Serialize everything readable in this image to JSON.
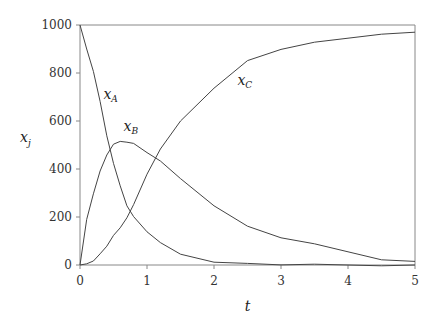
{
  "chart_data": {
    "type": "line",
    "title": "",
    "xlabel": "t",
    "ylabel": "x_j",
    "xlim": [
      0,
      5
    ],
    "ylim": [
      0,
      1000
    ],
    "xticks": [
      "0",
      "1",
      "2",
      "3",
      "4",
      "5"
    ],
    "yticks": [
      "0",
      "200",
      "400",
      "600",
      "800",
      "1000"
    ],
    "grid": false,
    "legend": "inline labels",
    "x": [
      0,
      0.1,
      0.2,
      0.3,
      0.4,
      0.5,
      0.6,
      0.7,
      0.8,
      1.0,
      1.2,
      1.5,
      2.0,
      2.5,
      3.0,
      3.5,
      4.0,
      4.5,
      5.0
    ],
    "series": [
      {
        "name": "x_A",
        "label": "x",
        "sub": "A",
        "values": [
          1000,
          900,
          810,
          680,
          540,
          420,
          330,
          250,
          200,
          140,
          90,
          45,
          15,
          5,
          2,
          0,
          0,
          0,
          0
        ]
      },
      {
        "name": "x_B",
        "label": "x",
        "sub": "B",
        "values": [
          0,
          190,
          300,
          390,
          460,
          500,
          515,
          515,
          505,
          470,
          430,
          360,
          250,
          160,
          115,
          85,
          55,
          25,
          15
        ]
      },
      {
        "name": "x_C",
        "label": "x",
        "sub": "C",
        "values": [
          0,
          5,
          20,
          45,
          80,
          120,
          155,
          200,
          250,
          380,
          480,
          600,
          740,
          850,
          900,
          925,
          945,
          965,
          970
        ]
      }
    ],
    "annotations": [
      {
        "text": "x_A",
        "t": 0.35,
        "y": 690
      },
      {
        "text": "x_B",
        "t": 0.65,
        "y": 560
      },
      {
        "text": "x_C",
        "t": 2.35,
        "y": 750
      }
    ]
  }
}
